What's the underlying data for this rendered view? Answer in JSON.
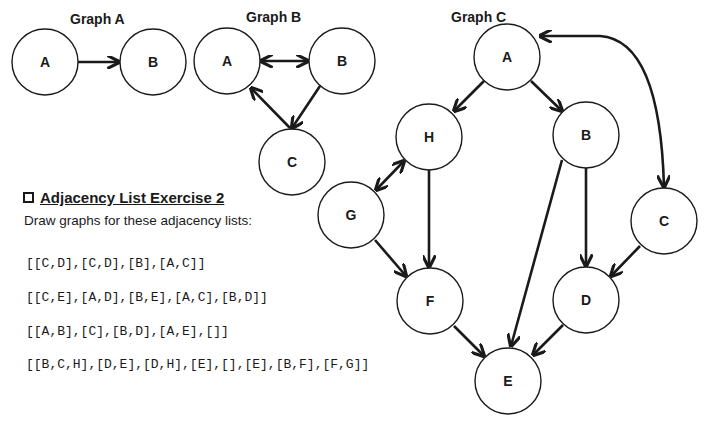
{
  "graphs": {
    "a": {
      "title": "Graph A",
      "nodes": [
        {
          "id": "A",
          "label": "A",
          "x": 45,
          "y": 62
        },
        {
          "id": "B",
          "label": "B",
          "x": 153,
          "y": 62
        }
      ],
      "edges": [
        {
          "from": "A",
          "to": "B",
          "directed": "forward"
        }
      ]
    },
    "b": {
      "title": "Graph B",
      "nodes": [
        {
          "id": "A",
          "label": "A",
          "x": 227,
          "y": 61
        },
        {
          "id": "B",
          "label": "B",
          "x": 342,
          "y": 61
        },
        {
          "id": "C",
          "label": "C",
          "x": 292,
          "y": 162
        }
      ],
      "edges": [
        {
          "from": "A",
          "to": "B",
          "directed": "both"
        },
        {
          "from": "B",
          "to": "C",
          "directed": "forward"
        },
        {
          "from": "C",
          "to": "A",
          "directed": "forward"
        }
      ]
    },
    "c": {
      "title": "Graph C",
      "nodes": [
        {
          "id": "A",
          "label": "A",
          "x": 507,
          "y": 57
        },
        {
          "id": "H",
          "label": "H",
          "x": 429,
          "y": 137
        },
        {
          "id": "B",
          "label": "B",
          "x": 586,
          "y": 135
        },
        {
          "id": "G",
          "label": "G",
          "x": 351,
          "y": 215
        },
        {
          "id": "C",
          "label": "C",
          "x": 664,
          "y": 221
        },
        {
          "id": "F",
          "label": "F",
          "x": 430,
          "y": 301
        },
        {
          "id": "D",
          "label": "D",
          "x": 586,
          "y": 300
        },
        {
          "id": "E",
          "label": "E",
          "x": 508,
          "y": 381
        }
      ],
      "edges": [
        {
          "from": "A",
          "to": "H",
          "directed": "forward"
        },
        {
          "from": "A",
          "to": "B",
          "directed": "forward"
        },
        {
          "from": "A",
          "to": "C",
          "directed": "both",
          "curved": true
        },
        {
          "from": "H",
          "to": "G",
          "directed": "both"
        },
        {
          "from": "H",
          "to": "F",
          "directed": "forward"
        },
        {
          "from": "G",
          "to": "F",
          "directed": "forward"
        },
        {
          "from": "B",
          "to": "D",
          "directed": "forward"
        },
        {
          "from": "B",
          "to": "E",
          "directed": "forward"
        },
        {
          "from": "C",
          "to": "D",
          "directed": "forward"
        },
        {
          "from": "F",
          "to": "E",
          "directed": "forward"
        },
        {
          "from": "D",
          "to": "E",
          "directed": "forward"
        }
      ]
    }
  },
  "exercise": {
    "title": "Adjacency List Exercise 2",
    "instructions": "Draw graphs for these adjacency lists:",
    "lists": [
      "[[C,D],[C,D],[B],[A,C]]",
      "[[C,E],[A,D],[B,E],[A,C],[B,D]]",
      "[[A,B],[C],[B,D],[A,E],[]]",
      "[[B,C,H],[D,E],[D,H],[E],[],[E],[B,F],[F,G]]"
    ]
  },
  "colors": {
    "ink": "#1a1a1a",
    "background": "#ffffff"
  }
}
